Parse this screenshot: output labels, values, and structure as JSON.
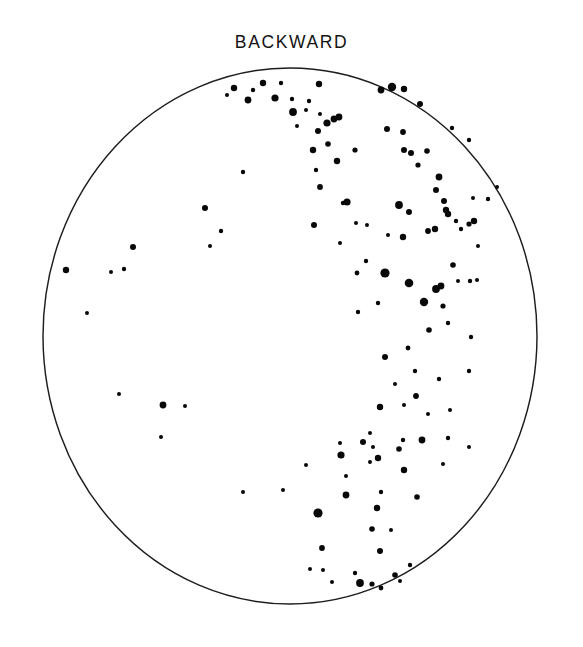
{
  "chart_data": {
    "type": "scatter",
    "title": "BACKWARD",
    "subtitle": "",
    "xlabel": "",
    "ylabel": "",
    "grid": false,
    "legend": null,
    "annotations": [],
    "projection": "circular stereographic pole figure",
    "boundary": {
      "shape": "circle",
      "center_px": [
        290,
        336
      ],
      "radius_x_px": 247,
      "radius_y_px": 268,
      "stroke_color": "#1d1d1d",
      "stroke_width_px": 1.45
    },
    "xlim": [
      -1,
      1
    ],
    "ylim": [
      -1,
      1
    ],
    "point_color": "#080808",
    "point_size_legend": {
      "tiny": 2.0,
      "small": 2.9,
      "medium": 3.8,
      "large": 5.0,
      "xlarge": 6.4
    },
    "n_points": 140,
    "points": [
      {
        "x": 227,
        "y": 95,
        "r": 2.0
      },
      {
        "x": 234,
        "y": 88,
        "r": 3.2
      },
      {
        "x": 248,
        "y": 100,
        "r": 3.4
      },
      {
        "x": 253,
        "y": 90,
        "r": 2.2
      },
      {
        "x": 275,
        "y": 98,
        "r": 3.6
      },
      {
        "x": 263,
        "y": 83,
        "r": 3.2
      },
      {
        "x": 281,
        "y": 83,
        "r": 2.2
      },
      {
        "x": 292,
        "y": 99,
        "r": 2.2
      },
      {
        "x": 293,
        "y": 112,
        "r": 3.9
      },
      {
        "x": 319,
        "y": 84,
        "r": 3.2
      },
      {
        "x": 309,
        "y": 101,
        "r": 2.2
      },
      {
        "x": 297,
        "y": 126,
        "r": 2.0
      },
      {
        "x": 306,
        "y": 110,
        "r": 2.0
      },
      {
        "x": 320,
        "y": 114,
        "r": 2.0
      },
      {
        "x": 318,
        "y": 131,
        "r": 3.0
      },
      {
        "x": 327,
        "y": 123,
        "r": 3.6
      },
      {
        "x": 334,
        "y": 119,
        "r": 3.4
      },
      {
        "x": 339,
        "y": 117,
        "r": 3.4
      },
      {
        "x": 328,
        "y": 144,
        "r": 2.8
      },
      {
        "x": 337,
        "y": 161,
        "r": 3.2
      },
      {
        "x": 355,
        "y": 150,
        "r": 2.6
      },
      {
        "x": 313,
        "y": 150,
        "r": 3.2
      },
      {
        "x": 316,
        "y": 170,
        "r": 2.2
      },
      {
        "x": 320,
        "y": 187,
        "r": 2.9
      },
      {
        "x": 314,
        "y": 225,
        "r": 3.0
      },
      {
        "x": 381,
        "y": 90,
        "r": 3.4
      },
      {
        "x": 392,
        "y": 87,
        "r": 4.2
      },
      {
        "x": 404,
        "y": 89,
        "r": 3.2
      },
      {
        "x": 420,
        "y": 104,
        "r": 3.0
      },
      {
        "x": 387,
        "y": 129,
        "r": 3.0
      },
      {
        "x": 403,
        "y": 132,
        "r": 2.9
      },
      {
        "x": 404,
        "y": 150,
        "r": 3.0
      },
      {
        "x": 411,
        "y": 153,
        "r": 3.0
      },
      {
        "x": 427,
        "y": 151,
        "r": 2.8
      },
      {
        "x": 418,
        "y": 165,
        "r": 2.6
      },
      {
        "x": 439,
        "y": 177,
        "r": 3.4
      },
      {
        "x": 436,
        "y": 190,
        "r": 3.0
      },
      {
        "x": 444,
        "y": 201,
        "r": 3.0
      },
      {
        "x": 446,
        "y": 210,
        "r": 3.2
      },
      {
        "x": 448,
        "y": 214,
        "r": 3.2
      },
      {
        "x": 469,
        "y": 140,
        "r": 2.2
      },
      {
        "x": 473,
        "y": 198,
        "r": 2.0
      },
      {
        "x": 343,
        "y": 203,
        "r": 2.2
      },
      {
        "x": 347,
        "y": 202,
        "r": 3.6
      },
      {
        "x": 452,
        "y": 128,
        "r": 2.2
      },
      {
        "x": 456,
        "y": 221,
        "r": 2.2
      },
      {
        "x": 399,
        "y": 205,
        "r": 3.9
      },
      {
        "x": 409,
        "y": 212,
        "r": 3.0
      },
      {
        "x": 403,
        "y": 237,
        "r": 3.2
      },
      {
        "x": 428,
        "y": 231,
        "r": 2.9
      },
      {
        "x": 435,
        "y": 229,
        "r": 3.2
      },
      {
        "x": 461,
        "y": 229,
        "r": 2.2
      },
      {
        "x": 356,
        "y": 223,
        "r": 2.0
      },
      {
        "x": 367,
        "y": 225,
        "r": 2.0
      },
      {
        "x": 388,
        "y": 235,
        "r": 2.0
      },
      {
        "x": 340,
        "y": 243,
        "r": 2.0
      },
      {
        "x": 366,
        "y": 261,
        "r": 2.2
      },
      {
        "x": 357,
        "y": 273,
        "r": 2.4
      },
      {
        "x": 385,
        "y": 273,
        "r": 4.6
      },
      {
        "x": 409,
        "y": 283,
        "r": 4.3
      },
      {
        "x": 441,
        "y": 286,
        "r": 3.4
      },
      {
        "x": 453,
        "y": 265,
        "r": 2.8
      },
      {
        "x": 469,
        "y": 224,
        "r": 2.6
      },
      {
        "x": 474,
        "y": 221,
        "r": 3.2
      },
      {
        "x": 478,
        "y": 246,
        "r": 2.0
      },
      {
        "x": 497,
        "y": 187,
        "r": 2.0
      },
      {
        "x": 488,
        "y": 199,
        "r": 2.2
      },
      {
        "x": 358,
        "y": 312,
        "r": 2.2
      },
      {
        "x": 378,
        "y": 303,
        "r": 2.2
      },
      {
        "x": 424,
        "y": 302,
        "r": 4.2
      },
      {
        "x": 436,
        "y": 289,
        "r": 3.9
      },
      {
        "x": 443,
        "y": 306,
        "r": 2.6
      },
      {
        "x": 448,
        "y": 323,
        "r": 2.2
      },
      {
        "x": 429,
        "y": 330,
        "r": 2.8
      },
      {
        "x": 458,
        "y": 281,
        "r": 2.0
      },
      {
        "x": 470,
        "y": 281,
        "r": 2.2
      },
      {
        "x": 408,
        "y": 348,
        "r": 2.4
      },
      {
        "x": 385,
        "y": 357,
        "r": 3.0
      },
      {
        "x": 415,
        "y": 371,
        "r": 2.2
      },
      {
        "x": 395,
        "y": 384,
        "r": 2.0
      },
      {
        "x": 416,
        "y": 396,
        "r": 2.9
      },
      {
        "x": 404,
        "y": 405,
        "r": 2.0
      },
      {
        "x": 380,
        "y": 407,
        "r": 3.2
      },
      {
        "x": 428,
        "y": 414,
        "r": 2.0
      },
      {
        "x": 439,
        "y": 379,
        "r": 2.2
      },
      {
        "x": 477,
        "y": 280,
        "r": 2.0
      },
      {
        "x": 471,
        "y": 337,
        "r": 2.2
      },
      {
        "x": 469,
        "y": 371,
        "r": 2.2
      },
      {
        "x": 370,
        "y": 433,
        "r": 2.0
      },
      {
        "x": 373,
        "y": 447,
        "r": 2.0
      },
      {
        "x": 363,
        "y": 442,
        "r": 3.0
      },
      {
        "x": 403,
        "y": 440,
        "r": 2.2
      },
      {
        "x": 399,
        "y": 449,
        "r": 2.8
      },
      {
        "x": 422,
        "y": 440,
        "r": 3.4
      },
      {
        "x": 378,
        "y": 458,
        "r": 3.2
      },
      {
        "x": 370,
        "y": 462,
        "r": 2.0
      },
      {
        "x": 341,
        "y": 455,
        "r": 3.6
      },
      {
        "x": 346,
        "y": 476,
        "r": 2.0
      },
      {
        "x": 404,
        "y": 470,
        "r": 3.2
      },
      {
        "x": 381,
        "y": 492,
        "r": 2.2
      },
      {
        "x": 377,
        "y": 508,
        "r": 3.2
      },
      {
        "x": 417,
        "y": 497,
        "r": 2.8
      },
      {
        "x": 346,
        "y": 495,
        "r": 3.4
      },
      {
        "x": 340,
        "y": 443,
        "r": 2.0
      },
      {
        "x": 450,
        "y": 410,
        "r": 2.0
      },
      {
        "x": 448,
        "y": 438,
        "r": 2.2
      },
      {
        "x": 469,
        "y": 447,
        "r": 2.0
      },
      {
        "x": 443,
        "y": 464,
        "r": 2.0
      },
      {
        "x": 391,
        "y": 530,
        "r": 2.0
      },
      {
        "x": 372,
        "y": 529,
        "r": 2.8
      },
      {
        "x": 380,
        "y": 551,
        "r": 3.0
      },
      {
        "x": 322,
        "y": 548,
        "r": 2.9
      },
      {
        "x": 355,
        "y": 573,
        "r": 2.2
      },
      {
        "x": 360,
        "y": 583,
        "r": 3.9
      },
      {
        "x": 372,
        "y": 584,
        "r": 2.6
      },
      {
        "x": 381,
        "y": 588,
        "r": 2.4
      },
      {
        "x": 395,
        "y": 575,
        "r": 2.8
      },
      {
        "x": 410,
        "y": 565,
        "r": 2.2
      },
      {
        "x": 400,
        "y": 581,
        "r": 2.0
      },
      {
        "x": 332,
        "y": 582,
        "r": 2.0
      },
      {
        "x": 310,
        "y": 569,
        "r": 2.0
      },
      {
        "x": 323,
        "y": 570,
        "r": 2.0
      },
      {
        "x": 318,
        "y": 513,
        "r": 4.6
      },
      {
        "x": 306,
        "y": 465,
        "r": 2.0
      },
      {
        "x": 283,
        "y": 490,
        "r": 2.0
      },
      {
        "x": 243,
        "y": 492,
        "r": 2.0
      },
      {
        "x": 161,
        "y": 437,
        "r": 2.0
      },
      {
        "x": 185,
        "y": 406,
        "r": 2.0
      },
      {
        "x": 163,
        "y": 405,
        "r": 3.4
      },
      {
        "x": 119,
        "y": 394,
        "r": 2.0
      },
      {
        "x": 124,
        "y": 269,
        "r": 2.2
      },
      {
        "x": 133,
        "y": 247,
        "r": 3.0
      },
      {
        "x": 66,
        "y": 270,
        "r": 3.2
      },
      {
        "x": 87,
        "y": 313,
        "r": 2.0
      },
      {
        "x": 111,
        "y": 272,
        "r": 2.0
      },
      {
        "x": 205,
        "y": 208,
        "r": 3.0
      },
      {
        "x": 210,
        "y": 246,
        "r": 2.0
      },
      {
        "x": 221,
        "y": 231,
        "r": 2.2
      },
      {
        "x": 243,
        "y": 172,
        "r": 2.2
      }
    ]
  },
  "figure": {
    "title_label": "BACKWARD",
    "background_color": "#ffffff",
    "axis_color": "#1d1d1d",
    "point_color": "#080808"
  }
}
